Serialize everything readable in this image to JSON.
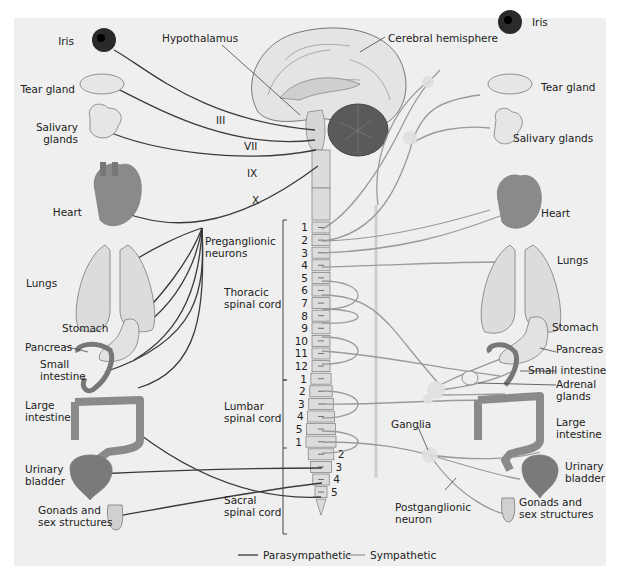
{
  "colors": {
    "parasympathetic": "#3a3a3a",
    "sympathetic": "#9a9a9a",
    "background": "#efefef"
  },
  "labels": {
    "hypothalamus": "Hypothalamus",
    "cerebral_hemisphere": "Cerebral hemisphere",
    "preganglionic": [
      "Preganglionic",
      "neurons"
    ],
    "thoracic": [
      "Thoracic",
      "spinal cord"
    ],
    "lumbar": [
      "Lumbar",
      "spinal cord"
    ],
    "sacral": [
      "Sacral",
      "spinal cord"
    ],
    "ganglia": "Ganglia",
    "postganglionic": [
      "Postganglionic",
      "neuron"
    ]
  },
  "cranial_nerves": [
    "III",
    "VII",
    "IX",
    "X"
  ],
  "left_organs": [
    {
      "name": "iris",
      "label": [
        "Iris"
      ]
    },
    {
      "name": "tear-gland",
      "label": [
        "Tear gland"
      ]
    },
    {
      "name": "salivary-glands",
      "label": [
        "Salivary",
        "glands"
      ]
    },
    {
      "name": "heart",
      "label": [
        "Heart"
      ]
    },
    {
      "name": "lungs",
      "label": [
        "Lungs"
      ]
    },
    {
      "name": "stomach",
      "label": [
        "Stomach"
      ]
    },
    {
      "name": "pancreas",
      "label": [
        "Pancreas"
      ]
    },
    {
      "name": "small-intestine",
      "label": [
        "Small",
        "intestine"
      ]
    },
    {
      "name": "large-intestine",
      "label": [
        "Large",
        "intestine"
      ]
    },
    {
      "name": "urinary-bladder",
      "label": [
        "Urinary",
        "bladder"
      ]
    },
    {
      "name": "gonads",
      "label": [
        "Gonads and",
        "sex structures"
      ]
    }
  ],
  "right_organs": [
    {
      "name": "iris",
      "label": [
        "Iris"
      ]
    },
    {
      "name": "tear-gland",
      "label": [
        "Tear gland"
      ]
    },
    {
      "name": "salivary-glands",
      "label": [
        "Salivary glands"
      ]
    },
    {
      "name": "heart",
      "label": [
        "Heart"
      ]
    },
    {
      "name": "lungs",
      "label": [
        "Lungs"
      ]
    },
    {
      "name": "stomach",
      "label": [
        "Stomach"
      ]
    },
    {
      "name": "pancreas",
      "label": [
        "Pancreas"
      ]
    },
    {
      "name": "small-intestine",
      "label": [
        "Small intestine"
      ]
    },
    {
      "name": "adrenal-glands",
      "label": [
        "Adrenal",
        "glands"
      ]
    },
    {
      "name": "large-intestine",
      "label": [
        "Large",
        "intestine"
      ]
    },
    {
      "name": "urinary-bladder",
      "label": [
        "Urinary",
        "bladder"
      ]
    },
    {
      "name": "gonads",
      "label": [
        "Gonads and",
        "sex structures"
      ]
    }
  ],
  "spinal_segments": {
    "thoracic": [
      "1",
      "2",
      "3",
      "4",
      "5",
      "6",
      "7",
      "8",
      "9",
      "10",
      "11",
      "12"
    ],
    "lumbar": [
      "1",
      "2",
      "3",
      "4",
      "5"
    ],
    "sacral": [
      "1",
      "2",
      "3",
      "4",
      "5"
    ]
  },
  "legend": [
    {
      "label": "Parasympathetic",
      "color": "#3a3a3a"
    },
    {
      "label": "Sympathetic",
      "color": "#9a9a9a"
    }
  ]
}
